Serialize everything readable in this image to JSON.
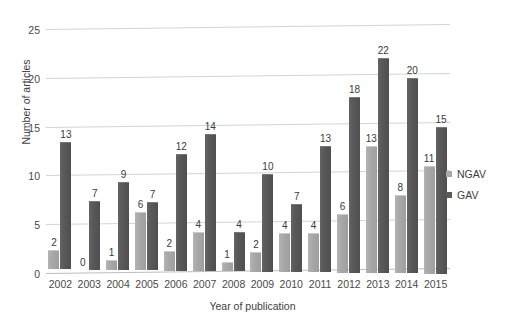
{
  "chart_data": {
    "type": "bar",
    "title": "",
    "xlabel": "Year of publication",
    "ylabel": "Number of articles",
    "categories": [
      "2002",
      "2003",
      "2004",
      "2005",
      "2006",
      "2007",
      "2008",
      "2009",
      "2010",
      "2011",
      "2012",
      "2013",
      "2014",
      "2015"
    ],
    "series": [
      {
        "name": "NGAV",
        "color": "#a9a9a9",
        "values": [
          2,
          0,
          1,
          6,
          2,
          4,
          1,
          2,
          4,
          4,
          6,
          13,
          8,
          11
        ]
      },
      {
        "name": "GAV",
        "color": "#5a5a5a",
        "values": [
          13,
          7,
          9,
          7,
          12,
          14,
          4,
          10,
          7,
          13,
          18,
          22,
          20,
          15
        ]
      }
    ],
    "ylim": [
      0,
      25
    ],
    "yticks": [
      0,
      5,
      10,
      15,
      20,
      25
    ],
    "grid": true,
    "legend_position": "right",
    "data_labels": true
  },
  "legend": {
    "items": [
      {
        "label": "NGAV"
      },
      {
        "label": "GAV"
      }
    ]
  }
}
